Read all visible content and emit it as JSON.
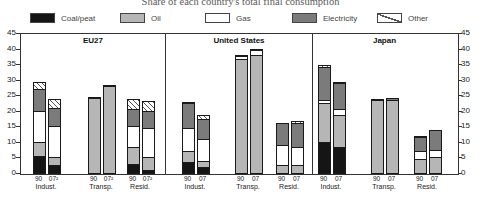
{
  "title": "Share of each country's total final consumption",
  "legend": {
    "items": [
      {
        "key": "coal",
        "label": "Coal/peat"
      },
      {
        "key": "oil",
        "label": "Oil"
      },
      {
        "key": "gas",
        "label": "Gas"
      },
      {
        "key": "electricity",
        "label": "Electricity"
      },
      {
        "key": "other",
        "label": "Other"
      }
    ]
  },
  "colors": {
    "coal": "#151515",
    "oil": "#b6b6b6",
    "gas": "#ffffff",
    "electricity": "#7b7b7b",
    "other_hatch_line": "#555555",
    "segment_border": "#1a1a1a",
    "frame": "#333333"
  },
  "chart_data": {
    "type": "bar",
    "stacked": true,
    "title": "Share of each country's total final consumption",
    "xlabel": "",
    "ylabel": "",
    "ylim": [
      0,
      45
    ],
    "yticks": [
      0,
      5,
      10,
      15,
      20,
      25,
      30,
      35,
      40,
      45
    ],
    "dual_axis": true,
    "grid": false,
    "legend_position": "top",
    "stack_order": [
      "coal",
      "oil",
      "gas",
      "electricity",
      "other"
    ],
    "panels": [
      {
        "title": "EU27",
        "group_x": [
          12,
          67,
          106
        ],
        "groups": [
          {
            "label": "Indust.",
            "bars": [
              {
                "year": "90",
                "values": {
                  "coal": 5.5,
                  "oil": 4.5,
                  "gas": 10,
                  "electricity": 7,
                  "other": 2.5
                }
              },
              {
                "year": "07²",
                "values": {
                  "coal": 2.5,
                  "oil": 2.5,
                  "gas": 10,
                  "electricity": 6,
                  "other": 3
                }
              }
            ]
          },
          {
            "label": "Transp.",
            "bars": [
              {
                "year": "90",
                "values": {
                  "oil": 24,
                  "electricity": 0.5
                }
              },
              {
                "year": "07²",
                "values": {
                  "oil": 28,
                  "electricity": 0.5
                }
              }
            ]
          },
          {
            "label": "Resid.",
            "bars": [
              {
                "year": "90",
                "values": {
                  "coal": 3,
                  "oil": 5.5,
                  "gas": 6.5,
                  "electricity": 5.5,
                  "other": 3.5
                }
              },
              {
                "year": "07²",
                "values": {
                  "coal": 1,
                  "oil": 4,
                  "gas": 9.5,
                  "electricity": 5.5,
                  "other": 3.5
                }
              }
            ]
          }
        ]
      },
      {
        "title": "United States",
        "group_x": [
          16,
          69,
          110
        ],
        "groups": [
          {
            "label": "Indust.",
            "bars": [
              {
                "year": "90",
                "values": {
                  "coal": 3.5,
                  "oil": 3.5,
                  "gas": 7.5,
                  "electricity": 8,
                  "other": 0.5
                }
              },
              {
                "year": "07",
                "values": {
                  "coal": 2,
                  "oil": 2,
                  "gas": 7,
                  "electricity": 6.5,
                  "other": 1.5
                }
              }
            ]
          },
          {
            "label": "Transp.",
            "bars": [
              {
                "year": "90",
                "values": {
                  "oil": 36.5,
                  "gas": 1,
                  "electricity": 0.5
                }
              },
              {
                "year": "07",
                "values": {
                  "oil": 38,
                  "gas": 1.5,
                  "electricity": 0.5
                }
              }
            ]
          },
          {
            "label": "Resid.",
            "bars": [
              {
                "year": "90",
                "values": {
                  "oil": 2.5,
                  "gas": 6.5,
                  "electricity": 7.5
                }
              },
              {
                "year": "07",
                "values": {
                  "oil": 2.5,
                  "gas": 6,
                  "electricity": 7.5,
                  "other": 1
                }
              }
            ]
          }
        ]
      },
      {
        "title": "Japan",
        "group_x": [
          5,
          58,
          101
        ],
        "groups": [
          {
            "label": "Indust.",
            "bars": [
              {
                "year": "90",
                "values": {
                  "coal": 10,
                  "oil": 12.5,
                  "gas": 1,
                  "electricity": 10.5,
                  "other": 1
                }
              },
              {
                "year": "07",
                "values": {
                  "coal": 8.5,
                  "oil": 10,
                  "gas": 2,
                  "electricity": 8.5,
                  "other": 0.5
                }
              }
            ]
          },
          {
            "label": "Transp.",
            "bars": [
              {
                "year": "90",
                "values": {
                  "oil": 23.5,
                  "electricity": 0.5
                }
              },
              {
                "year": "07",
                "values": {
                  "oil": 23.5,
                  "electricity": 1
                }
              }
            ]
          },
          {
            "label": "Resid.",
            "bars": [
              {
                "year": "90",
                "values": {
                  "oil": 4.5,
                  "gas": 2.5,
                  "electricity": 4.5,
                  "other": 0.5
                }
              },
              {
                "year": "07",
                "values": {
                  "oil": 5,
                  "gas": 2.5,
                  "electricity": 6.5
                }
              }
            ]
          }
        ]
      }
    ]
  }
}
